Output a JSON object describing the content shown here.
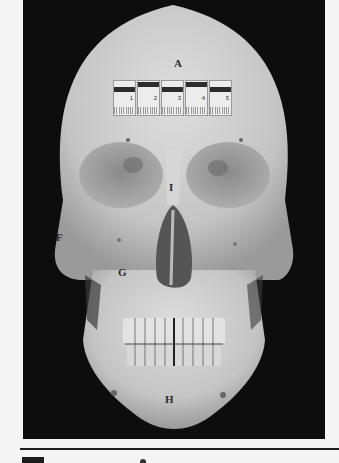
{
  "figure": {
    "background_color": "#0d0d0d",
    "bone_color": "#cfcfcf",
    "labels": [
      {
        "id": "A",
        "text": "A",
        "x": 155,
        "y": 62
      },
      {
        "id": "I",
        "text": "I",
        "x": 147,
        "y": 182
      },
      {
        "id": "F",
        "text": "F",
        "x": 35,
        "y": 232
      },
      {
        "id": "G",
        "text": "G",
        "x": 98,
        "y": 267
      },
      {
        "id": "H",
        "text": "H",
        "x": 145,
        "y": 394
      }
    ],
    "scale_ruler": {
      "units": "mm",
      "segments": [
        "1",
        "2",
        "3",
        "4",
        "5"
      ]
    }
  }
}
